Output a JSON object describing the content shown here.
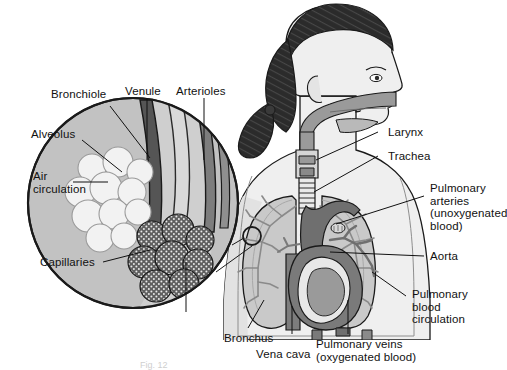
{
  "figure": {
    "background_color": "#ffffff",
    "line_color": "#111111",
    "caption_fragment": "Fig. 12"
  },
  "palette": {
    "skin": "#efefef",
    "skin_shadow": "#d8d8d8",
    "hair": "#2b2b2b",
    "lung": "#c9c9c9",
    "lung_light": "#dcdcdc",
    "airway": "#9a9a9a",
    "vessel_dark": "#6f6f6f",
    "vessel_mid": "#8a8a8a",
    "heart_dark": "#7a7a7a",
    "heart_light": "#e8e8e8",
    "inset_fill": "#c2c2c2",
    "alveolus_fill": "#f2f2f2",
    "capillary_fill": "#5a5a5a",
    "outline": "#1a1a1a"
  },
  "labels": {
    "bronchiole": "Bronchiole",
    "alveolus": "Alveolus",
    "air_circulation": "Air\ncirculation",
    "capillaries": "Capillaries",
    "venule": "Venule",
    "arterioles": "Arterioles",
    "larynx": "Larynx",
    "trachea": "Trachea",
    "pulmonary_arteries": "Pulmonary\narteries\n(unoxygenated\nblood)",
    "aorta": "Aorta",
    "pulmonary_blood_circulation": "Pulmonary\nblood\ncirculation",
    "bronchus": "Bronchus",
    "vena_cava": "Vena cava",
    "pulmonary_veins": "Pulmonary veins\n(oxygenated blood)"
  }
}
